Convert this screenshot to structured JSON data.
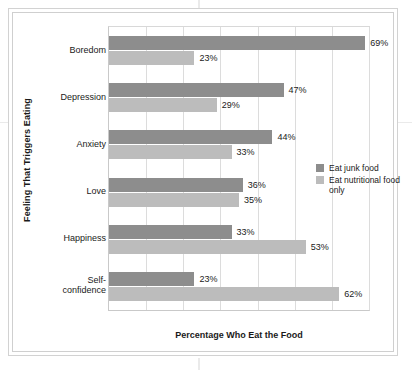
{
  "chart_data": {
    "type": "bar",
    "orientation": "horizontal",
    "title": "",
    "xlabel": "Percentage Who Eat the Food",
    "ylabel": "Feeling That Triggers Eating",
    "categories": [
      "Boredom",
      "Depression",
      "Anxiety",
      "Love",
      "Happiness",
      "Self-confidence"
    ],
    "series": [
      {
        "name": "Eat junk food",
        "color": "#8d8d8d",
        "values": [
          69,
          47,
          44,
          36,
          33,
          23
        ],
        "labels": [
          "69%",
          "47%",
          "44%",
          "36%",
          "33%",
          "23%"
        ]
      },
      {
        "name": "Eat nutritional food only",
        "color": "#bcbcbc",
        "values": [
          23,
          29,
          33,
          35,
          53,
          62
        ],
        "labels": [
          "23%",
          "29%",
          "33%",
          "35%",
          "53%",
          "62%"
        ]
      }
    ],
    "xlim": [
      0,
      70
    ],
    "gridlines": [
      0,
      10,
      20,
      30,
      40,
      50,
      60,
      70
    ],
    "grid": true,
    "xtick_labels": [],
    "legend_position": "right-middle"
  },
  "legend": {
    "entries": [
      {
        "label": "Eat junk food",
        "swatch": "junk"
      },
      {
        "label": "Eat nutritional food only",
        "swatch": "nutri"
      }
    ]
  },
  "axes": {
    "y_title": "Feeling That Triggers Eating",
    "x_title": "Percentage Who Eat the Food"
  },
  "category_labels": [
    "Boredom",
    "Depression",
    "Anxiety",
    "Love",
    "Happiness",
    "Self-confidence"
  ]
}
